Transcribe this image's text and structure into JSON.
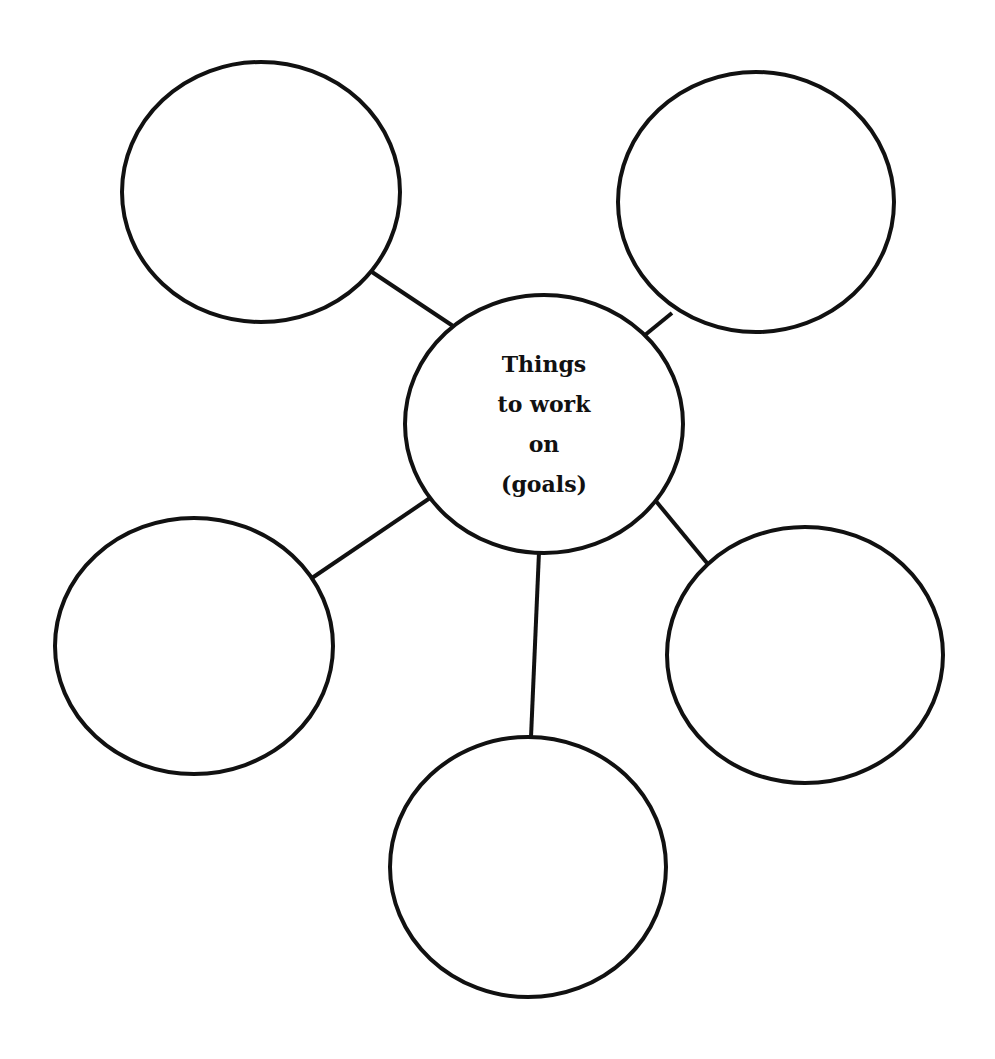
{
  "diagram": {
    "type": "mind-map",
    "stroke_color": "#111111",
    "background_color": "#ffffff",
    "center": {
      "lines": [
        "Things",
        "to work",
        "on",
        "(goals)"
      ],
      "cx": 544,
      "cy": 424,
      "rx": 139,
      "ry": 129
    },
    "satellites": [
      {
        "id": "top-left",
        "label": "",
        "cx": 261,
        "cy": 192,
        "rx": 139,
        "ry": 130
      },
      {
        "id": "top-right",
        "label": "",
        "cx": 756,
        "cy": 202,
        "rx": 138,
        "ry": 130
      },
      {
        "id": "middle-left",
        "label": "",
        "cx": 194,
        "cy": 646,
        "rx": 139,
        "ry": 128
      },
      {
        "id": "middle-right",
        "label": "",
        "cx": 805,
        "cy": 655,
        "rx": 138,
        "ry": 128
      },
      {
        "id": "bottom",
        "label": "",
        "cx": 528,
        "cy": 867,
        "rx": 138,
        "ry": 130
      }
    ],
    "connectors": [
      {
        "to": "top-left",
        "x1": 453,
        "y1": 326,
        "x2": 372,
        "y2": 272
      },
      {
        "to": "top-right",
        "x1": 645,
        "y1": 335,
        "x2": 672,
        "y2": 313
      },
      {
        "to": "middle-left",
        "x1": 430,
        "y1": 498,
        "x2": 312,
        "y2": 578
      },
      {
        "to": "middle-right",
        "x1": 655,
        "y1": 500,
        "x2": 707,
        "y2": 563
      },
      {
        "to": "bottom",
        "x1": 539,
        "y1": 552,
        "x2": 531,
        "y2": 737
      }
    ]
  }
}
